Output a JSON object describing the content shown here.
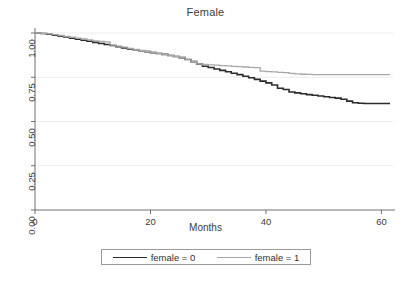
{
  "chart_data": {
    "type": "line",
    "title": "Female",
    "subtitle": "",
    "xlabel": "Months",
    "ylabel": "",
    "xlim": [
      0,
      62
    ],
    "ylim": [
      0,
      1
    ],
    "xticks": [
      "0",
      "20",
      "40",
      "60"
    ],
    "xtick_values": [
      0,
      20,
      40,
      60
    ],
    "yticks": [
      "0.00",
      "0.25",
      "0.50",
      "0.75",
      "1.00"
    ],
    "ytick_values": [
      0,
      0.25,
      0.5,
      0.75,
      1.0
    ],
    "grid": "horizontal",
    "legend_position": "below-axis",
    "series": [
      {
        "name": "female = 0",
        "color": "#2b2b2b",
        "linewidth": 1.6,
        "points": [
          [
            0,
            1.0
          ],
          [
            1,
            0.997
          ],
          [
            2,
            0.993
          ],
          [
            3,
            0.988
          ],
          [
            4,
            0.982
          ],
          [
            5,
            0.977
          ],
          [
            6,
            0.971
          ],
          [
            7,
            0.965
          ],
          [
            8,
            0.959
          ],
          [
            9,
            0.953
          ],
          [
            10,
            0.947
          ],
          [
            11,
            0.941
          ],
          [
            12,
            0.935
          ],
          [
            13,
            0.929
          ],
          [
            14,
            0.922
          ],
          [
            15,
            0.916
          ],
          [
            16,
            0.91
          ],
          [
            17,
            0.905
          ],
          [
            18,
            0.9
          ],
          [
            19,
            0.895
          ],
          [
            20,
            0.889
          ],
          [
            21,
            0.884
          ],
          [
            22,
            0.879
          ],
          [
            23,
            0.873
          ],
          [
            24,
            0.867
          ],
          [
            25,
            0.861
          ],
          [
            26,
            0.85
          ],
          [
            27,
            0.838
          ],
          [
            28,
            0.824
          ],
          [
            29,
            0.812
          ],
          [
            30,
            0.805
          ],
          [
            31,
            0.797
          ],
          [
            32,
            0.789
          ],
          [
            33,
            0.781
          ],
          [
            34,
            0.773
          ],
          [
            35,
            0.765
          ],
          [
            36,
            0.756
          ],
          [
            37,
            0.747
          ],
          [
            38,
            0.738
          ],
          [
            39,
            0.728
          ],
          [
            40,
            0.718
          ],
          [
            41,
            0.706
          ],
          [
            42,
            0.688
          ],
          [
            43,
            0.681
          ],
          [
            44,
            0.667
          ],
          [
            45,
            0.662
          ],
          [
            46,
            0.657
          ],
          [
            47,
            0.652
          ],
          [
            48,
            0.648
          ],
          [
            49,
            0.644
          ],
          [
            50,
            0.64
          ],
          [
            51,
            0.636
          ],
          [
            52,
            0.632
          ],
          [
            53,
            0.626
          ],
          [
            54,
            0.615
          ],
          [
            55,
            0.606
          ],
          [
            56,
            0.603
          ],
          [
            57,
            0.602
          ],
          [
            58,
            0.602
          ],
          [
            59,
            0.602
          ],
          [
            60,
            0.602
          ],
          [
            61.5,
            0.602
          ]
        ]
      },
      {
        "name": "female = 1",
        "color": "#a8a8a8",
        "linewidth": 1.3,
        "points": [
          [
            0,
            1.0
          ],
          [
            1,
            0.998
          ],
          [
            2,
            0.995
          ],
          [
            3,
            0.991
          ],
          [
            4,
            0.986
          ],
          [
            5,
            0.981
          ],
          [
            6,
            0.976
          ],
          [
            7,
            0.971
          ],
          [
            8,
            0.966
          ],
          [
            9,
            0.961
          ],
          [
            10,
            0.956
          ],
          [
            11,
            0.952
          ],
          [
            12,
            0.95
          ],
          [
            12.6,
            0.95
          ],
          [
            13,
            0.932
          ],
          [
            14,
            0.926
          ],
          [
            15,
            0.92
          ],
          [
            16,
            0.913
          ],
          [
            17,
            0.907
          ],
          [
            18,
            0.901
          ],
          [
            19,
            0.896
          ],
          [
            20,
            0.89
          ],
          [
            21,
            0.885
          ],
          [
            22,
            0.88
          ],
          [
            23,
            0.874
          ],
          [
            24,
            0.868
          ],
          [
            25,
            0.862
          ],
          [
            26,
            0.851
          ],
          [
            27,
            0.839
          ],
          [
            28,
            0.825
          ],
          [
            29,
            0.822
          ],
          [
            30,
            0.82
          ],
          [
            31,
            0.818
          ],
          [
            32,
            0.816
          ],
          [
            33,
            0.814
          ],
          [
            34,
            0.812
          ],
          [
            35,
            0.81
          ],
          [
            36,
            0.808
          ],
          [
            37,
            0.806
          ],
          [
            38,
            0.804
          ],
          [
            38.6,
            0.804
          ],
          [
            39,
            0.785
          ],
          [
            40,
            0.782
          ],
          [
            41,
            0.78
          ],
          [
            42,
            0.778
          ],
          [
            43,
            0.776
          ],
          [
            44,
            0.772
          ],
          [
            45,
            0.769
          ],
          [
            46,
            0.767
          ],
          [
            47,
            0.766
          ],
          [
            48,
            0.765
          ],
          [
            50,
            0.765
          ],
          [
            52,
            0.765
          ],
          [
            55,
            0.765
          ],
          [
            58,
            0.765
          ],
          [
            61.5,
            0.765
          ]
        ]
      }
    ],
    "annotations": []
  },
  "legend": {
    "entries": [
      {
        "label": "female = 0",
        "swatch": "dark-line-swatch"
      },
      {
        "label": "female = 1",
        "swatch": "gray-line-swatch"
      }
    ]
  },
  "caption": {
    "text": ""
  }
}
